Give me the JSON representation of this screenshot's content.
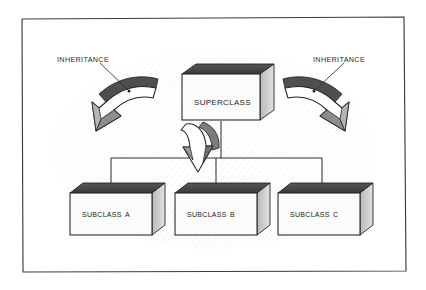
{
  "diagram": {
    "title_text_style": "small-caps",
    "frame": {
      "name": "hand-drawn-border"
    },
    "superclass": {
      "label": "Superclass",
      "x": 182,
      "y": 74,
      "width": 78,
      "height": 46
    },
    "subclasses": [
      {
        "label": "Subclass A",
        "x": 70,
        "y": 193,
        "width": 82,
        "height": 42
      },
      {
        "label": "Subclass B",
        "x": 175,
        "y": 193,
        "width": 82,
        "height": 42
      },
      {
        "label": "Subclass C",
        "x": 278,
        "y": 193,
        "width": 82,
        "height": 42
      }
    ],
    "annotations": [
      {
        "label": "INHERITANCE",
        "x": 57,
        "y": 55,
        "side": "left"
      },
      {
        "label": "INHERITANCE",
        "x": 313,
        "y": 55,
        "side": "right"
      }
    ],
    "arrows": [
      {
        "name": "inheritance-arrow-left",
        "direction": "curve-down-left"
      },
      {
        "name": "inheritance-arrow-right",
        "direction": "curve-down-right"
      },
      {
        "name": "inheritance-arrow-center",
        "direction": "down"
      }
    ],
    "colors": {
      "ink": "#1d1d1d",
      "paper": "#ffffff",
      "box_face": "#fbfbfa",
      "box_top": "#4a4a4a",
      "box_side": "#cfcfcf",
      "arrow_fill": "#ffffff",
      "arrow_shade": "#8d8d8d",
      "arrow_dark": "#4f4f4f",
      "hatch": "#9a9a9a"
    }
  }
}
